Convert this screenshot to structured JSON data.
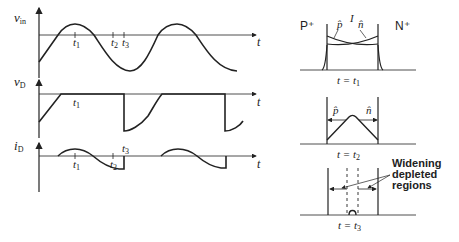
{
  "waveforms": {
    "vin": {
      "label": "v",
      "sub": "in",
      "axis_label": "t"
    },
    "vd": {
      "label": "v",
      "sub": "D",
      "axis_label": "t"
    },
    "id": {
      "label": "i",
      "sub": "D",
      "axis_label": "t"
    },
    "time_markers": {
      "t1": "t",
      "t1_sub": "1",
      "t2": "t",
      "t2_sub": "2",
      "t3": "t",
      "t3_sub": "3"
    }
  },
  "profiles": {
    "p_region": "P⁺",
    "n_region": "N⁺",
    "p_hat": "p̂",
    "n_hat": "n̂",
    "current_label": "I",
    "panel1_caption": "t = t",
    "panel1_sub": "1",
    "panel2_caption": "t = t",
    "panel2_sub": "2",
    "panel3_caption": "t = t",
    "panel3_sub": "3",
    "annotation_line1": "Widening",
    "annotation_line2": "depleted",
    "annotation_line3": "regions"
  },
  "colors": {
    "ink": "#222222",
    "background": "#ffffff"
  }
}
